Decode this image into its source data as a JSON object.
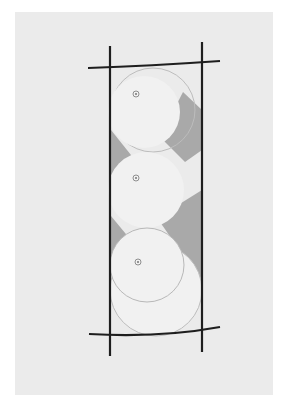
{
  "figure": {
    "colors": {
      "background": "#ffffff",
      "panel": "#ebebeb",
      "stroke": "#1e1e1e",
      "circle_fill": "#f1f1f1",
      "circle_stroke": "#b4b4b4",
      "shade": "#a9a9a9"
    },
    "centers": [
      {
        "label": "center-marker-1",
        "x": 136,
        "y": 94
      },
      {
        "label": "center-marker-2",
        "x": 136,
        "y": 178
      },
      {
        "label": "center-marker-3",
        "x": 138,
        "y": 262
      }
    ]
  },
  "caption": {
    "text": ""
  }
}
